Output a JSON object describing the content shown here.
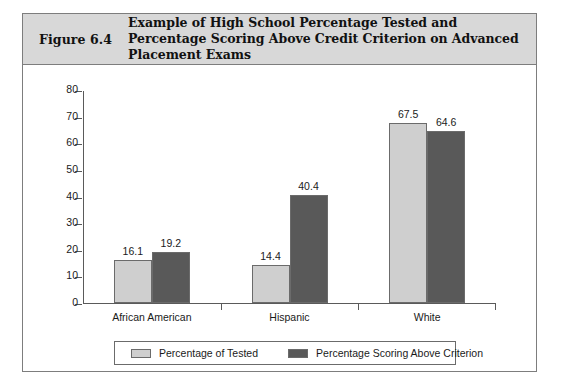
{
  "figure": {
    "number": "Figure 6.4",
    "title": "Example of High School Percentage Tested and Percentage Scoring Above Credit Criterion on Advanced Placement Exams"
  },
  "colors": {
    "header_band": "#d8d8d8",
    "frame_border": "#7d7d7d",
    "series_light": "#cfcfcf",
    "series_dark": "#595959",
    "axis": "#5a5a5a",
    "text": "#1a1a1a"
  },
  "chart_data": {
    "type": "bar",
    "title": "Example of High School Percentage Tested and Percentage Scoring Above Credit Criterion on Advanced Placement Exams",
    "xlabel": "",
    "ylabel": "",
    "categories": [
      "African American",
      "Hispanic",
      "White"
    ],
    "series": [
      {
        "name": "Percentage of Tested",
        "color": "#cfcfcf",
        "values": [
          16.1,
          14.4,
          67.5
        ],
        "value_labels": [
          "16.1",
          "14.4",
          "67.5"
        ]
      },
      {
        "name": "Percentage Scoring Above Criterion",
        "color": "#595959",
        "values": [
          19.2,
          40.4,
          64.6
        ],
        "value_labels": [
          "19.2",
          "40.4",
          "64.6"
        ]
      }
    ],
    "ylim": [
      0,
      80
    ],
    "yticks": [
      0,
      10,
      20,
      30,
      40,
      50,
      60,
      70,
      80
    ],
    "ytick_labels": [
      "0",
      "10",
      "20",
      "30",
      "40",
      "50",
      "60",
      "70",
      "80"
    ],
    "grid": false,
    "legend_position": "bottom"
  },
  "legend": {
    "entries": [
      {
        "label": "Percentage of Tested",
        "swatch": "light"
      },
      {
        "label": "Percentage Scoring Above Criterion",
        "swatch": "dark"
      }
    ]
  }
}
